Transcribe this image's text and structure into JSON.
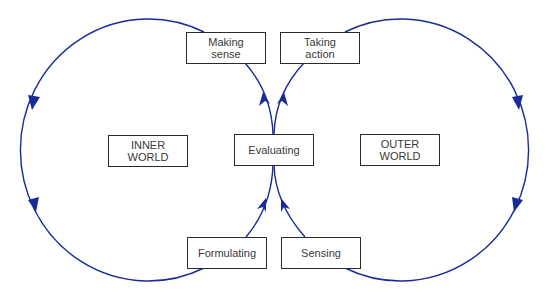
{
  "diagram": {
    "type": "double-loop process diagram",
    "line_color": "#1a2a9a",
    "box_border_color": "#2a2a2a",
    "text_color": "#3a3a3a",
    "nodes": {
      "making_sense": "Making\nsense",
      "taking_action": "Taking\naction",
      "evaluating": "Evaluating",
      "inner_world": "INNER\nWORLD",
      "outer_world": "OUTER\nWORLD",
      "formulating": "Formulating",
      "sensing": "Sensing"
    },
    "edges": [
      {
        "from": "Making sense",
        "to": "Formulating",
        "via": "inner loop (left arc, counter-clockwise)"
      },
      {
        "from": "Formulating",
        "to": "Evaluating"
      },
      {
        "from": "Evaluating",
        "to": "Taking action"
      },
      {
        "from": "Taking action",
        "to": "Sensing",
        "via": "outer loop (right arc, clockwise)"
      },
      {
        "from": "Sensing",
        "to": "Evaluating"
      },
      {
        "from": "Evaluating",
        "to": "Making sense"
      }
    ]
  }
}
